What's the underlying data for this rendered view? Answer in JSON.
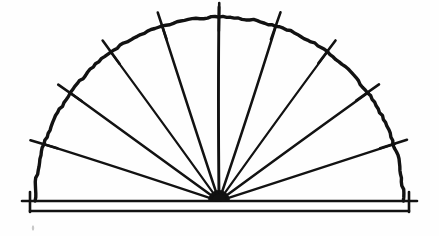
{
  "figure": {
    "type": "line-drawing",
    "background_color": "#fefefe",
    "ink_color": "#121212",
    "caption": ""
  },
  "chart_data": {
    "type": "scatter",
    "xlabel": "",
    "ylabel": "",
    "center": {
      "x": 219,
      "y": 201
    },
    "radius": 184,
    "arc": {
      "start_angle_deg": 0,
      "end_angle_deg": 180,
      "stroke_width": 3.4
    },
    "spokes": {
      "count": 9,
      "angles_deg": [
        0,
        18,
        36,
        54,
        72,
        90,
        108,
        126,
        144,
        162,
        180
      ],
      "drawn_angles_deg": [
        18,
        36,
        54,
        72,
        90,
        108,
        126,
        144,
        162
      ],
      "stroke_width": 2.2,
      "vertical_overshoot_px": 10
    },
    "ticks": {
      "count": 9,
      "angles_deg": [
        18,
        36,
        54,
        72,
        90,
        108,
        126,
        144,
        162
      ],
      "inner_offset_px": -14,
      "outer_offset_px": 14,
      "stroke_width": 2.6
    },
    "baseline": {
      "upper_y": 201,
      "lower_y": 211,
      "left_x": 22,
      "right_x": 417,
      "stroke_width": 2.6,
      "endcap_height": 14
    },
    "hub": {
      "x": 219,
      "y": 201,
      "radius_px": 7
    },
    "artifact_speck": {
      "x": 33,
      "y": 228,
      "r": 1.2
    }
  },
  "labels": {
    "arc_name": "semicircular-arc",
    "spoke_name": "radial-spoke",
    "tick_name": "angle-tick",
    "baseline_name": "base-rail",
    "hub_name": "center-hub"
  }
}
